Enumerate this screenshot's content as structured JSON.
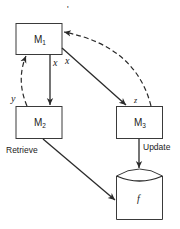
{
  "diagram": {
    "nodes": [
      {
        "id": "M1",
        "label": "M",
        "subscript": "1",
        "shape": "rectangle"
      },
      {
        "id": "M2",
        "label": "M",
        "subscript": "2",
        "shape": "rectangle"
      },
      {
        "id": "M3",
        "label": "M",
        "subscript": "3",
        "shape": "rectangle"
      },
      {
        "id": "f",
        "label": "f",
        "shape": "cylinder"
      }
    ],
    "edges": [
      {
        "from": "M1",
        "to": "M2",
        "label": "x",
        "style": "solid"
      },
      {
        "from": "M1",
        "to": "M3",
        "label": "x",
        "style": "solid"
      },
      {
        "from": "M2",
        "to": "M1",
        "label": "y",
        "style": "dashed"
      },
      {
        "from": "M3",
        "to": "M1",
        "label": "z",
        "style": "dashed"
      },
      {
        "from": "M2",
        "to": "f",
        "label": "Retrieve",
        "style": "solid"
      },
      {
        "from": "M3",
        "to": "f",
        "label": "Update",
        "style": "solid"
      }
    ],
    "labels": {
      "m": "M",
      "s1": "1",
      "s2": "2",
      "s3": "3",
      "f": "f",
      "x_left": "x",
      "x_right": "x",
      "y": "y",
      "z": "z",
      "retrieve": "Retrieve",
      "update": "Update",
      "stray_mark": "'"
    }
  }
}
